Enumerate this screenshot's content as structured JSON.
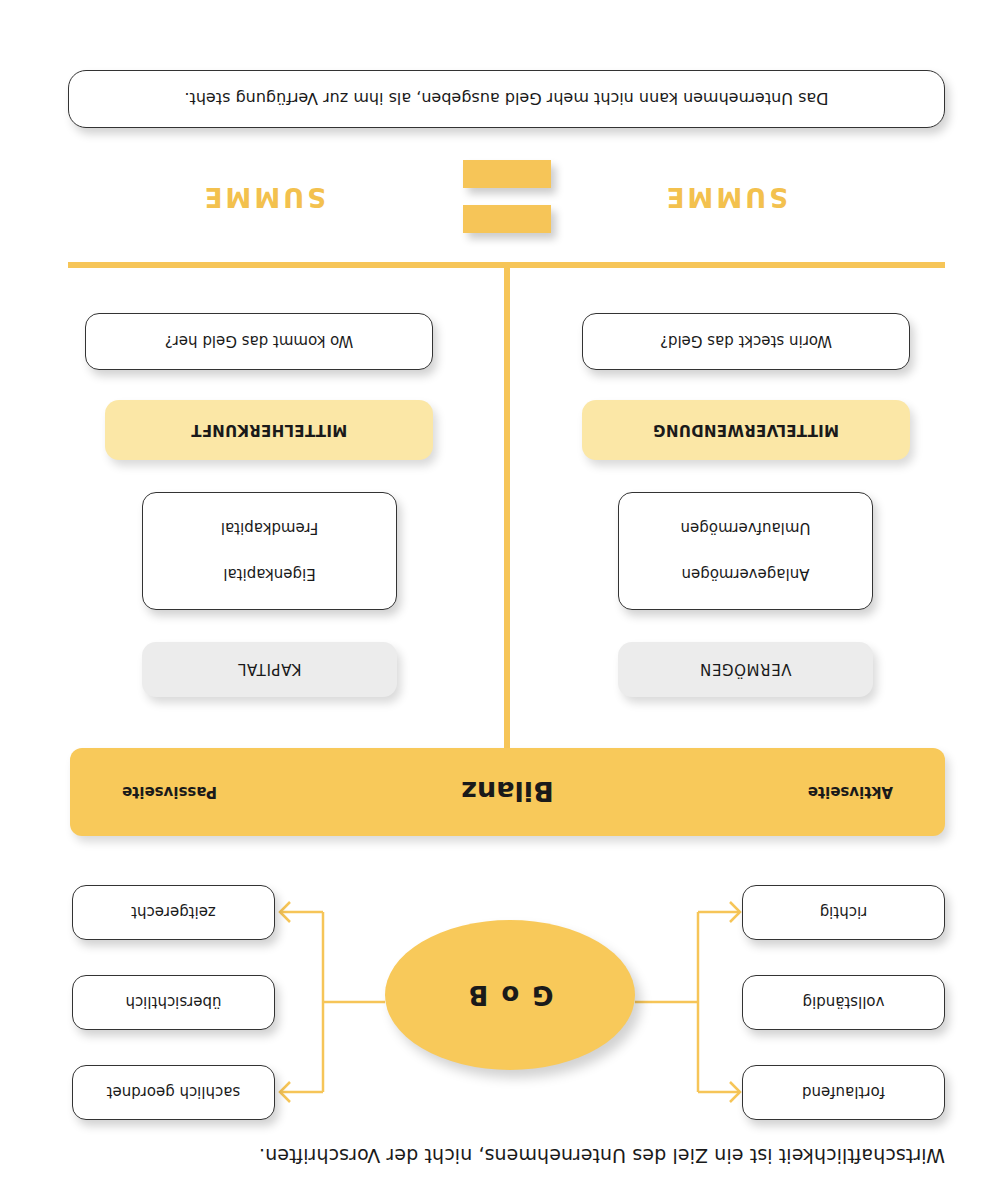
{
  "caption": "Wirtschaftlichkeit ist ein Ziel des Unternehmens, nicht der Vorschriften.",
  "gob": {
    "label": "G o B",
    "left_items": [
      "fortlaufend",
      "vollständig",
      "richtig"
    ],
    "right_items": [
      "sachlich geordnet",
      "übersichtlich",
      "zeitgerecht"
    ]
  },
  "bilanz": {
    "title": "Bilanz",
    "left_side": "Aktivseite",
    "right_side": "Passivseite"
  },
  "aktiva": {
    "category": "VERMÖGEN",
    "items": [
      "Anlagevermögen",
      "Umlaufvermögen"
    ],
    "role": "MITTELVERWENDUNG",
    "question": "Worin steckt das Geld?"
  },
  "passiva": {
    "category": "KAPITAL",
    "items": [
      "Eigenkapital",
      "Fremdkapital"
    ],
    "role": "MITTELHERKUNFT",
    "question": "Wo kommt das Geld her?"
  },
  "summe": {
    "left": "SUMME",
    "right": "SUMME",
    "equals_symbol": "="
  },
  "note": "Das Unternehmen kann nicht mehr Geld ausgeben, als ihm zur Verfügung steht.",
  "colors": {
    "accent": "#f8c95a",
    "accent_light": "#fbe7a6",
    "line": "#f6c558",
    "grey_label": "#ececec",
    "text": "#1a1a1a"
  }
}
